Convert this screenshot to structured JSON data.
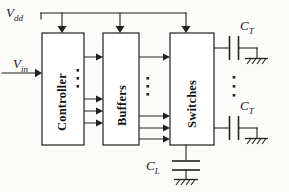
{
  "figure": {
    "type": "block-circuit-diagram",
    "background_color": "#fbfbfa",
    "line_color": "#23201e"
  },
  "labels": {
    "vdd": {
      "main": "V",
      "sub": "dd"
    },
    "vin": {
      "main": "V",
      "sub": "in"
    },
    "ct_top": {
      "main": "C",
      "sub": "T"
    },
    "ct_bottom": {
      "main": "C",
      "sub": "T"
    },
    "cl": {
      "main": "C",
      "sub": "L"
    }
  },
  "blocks": [
    {
      "id": "controller",
      "label": "Controller"
    },
    {
      "id": "buffers",
      "label": "Buffers"
    },
    {
      "id": "switches",
      "label": "Switches"
    }
  ],
  "nets": {
    "supply_rail": "Vdd",
    "input_signal": "Vin",
    "load_cap": "CL",
    "tuning_caps": [
      "CT",
      "CT"
    ]
  },
  "ellipses": {
    "controller_to_buffers": "vertical-dots",
    "buffers_to_switches": "vertical-dots",
    "switch_outputs": "vertical-dots"
  }
}
